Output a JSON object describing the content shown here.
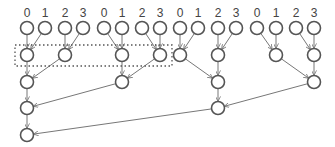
{
  "diagram": {
    "type": "reduction-tree",
    "labels": [
      "0",
      "1",
      "2",
      "3",
      "0",
      "1",
      "2",
      "3",
      "0",
      "1",
      "2",
      "3",
      "0",
      "1",
      "2",
      "3"
    ],
    "colors": {
      "node_stroke": "#555555",
      "edge": "#777777",
      "label": "#444444",
      "background": "#ffffff"
    },
    "nodes": [
      {
        "id": "t0",
        "x": 27,
        "y": 28
      },
      {
        "id": "t1",
        "x": 45,
        "y": 28
      },
      {
        "id": "t2",
        "x": 65,
        "y": 28
      },
      {
        "id": "t3",
        "x": 83,
        "y": 28
      },
      {
        "id": "t4",
        "x": 104,
        "y": 28
      },
      {
        "id": "t5",
        "x": 122,
        "y": 28
      },
      {
        "id": "t6",
        "x": 142,
        "y": 28
      },
      {
        "id": "t7",
        "x": 160,
        "y": 28
      },
      {
        "id": "t8",
        "x": 180,
        "y": 28
      },
      {
        "id": "t9",
        "x": 198,
        "y": 28
      },
      {
        "id": "t10",
        "x": 218,
        "y": 28
      },
      {
        "id": "t11",
        "x": 236,
        "y": 28
      },
      {
        "id": "t12",
        "x": 257,
        "y": 28
      },
      {
        "id": "t13",
        "x": 276,
        "y": 28
      },
      {
        "id": "t14",
        "x": 296,
        "y": 28
      },
      {
        "id": "t15",
        "x": 314,
        "y": 28
      },
      {
        "id": "a0",
        "x": 27,
        "y": 55
      },
      {
        "id": "a1",
        "x": 65,
        "y": 55
      },
      {
        "id": "a2",
        "x": 122,
        "y": 55
      },
      {
        "id": "a3",
        "x": 160,
        "y": 55
      },
      {
        "id": "a4",
        "x": 180,
        "y": 55
      },
      {
        "id": "a5",
        "x": 218,
        "y": 55
      },
      {
        "id": "a6",
        "x": 276,
        "y": 55
      },
      {
        "id": "a7",
        "x": 314,
        "y": 55
      },
      {
        "id": "b0",
        "x": 27,
        "y": 82
      },
      {
        "id": "b1",
        "x": 122,
        "y": 82
      },
      {
        "id": "b2",
        "x": 218,
        "y": 82
      },
      {
        "id": "b3",
        "x": 314,
        "y": 82
      },
      {
        "id": "c0",
        "x": 27,
        "y": 108
      },
      {
        "id": "c1",
        "x": 218,
        "y": 108
      },
      {
        "id": "d0",
        "x": 27,
        "y": 135
      }
    ],
    "edges": [
      [
        "t0",
        "a0"
      ],
      [
        "t1",
        "a0"
      ],
      [
        "t2",
        "a1"
      ],
      [
        "t3",
        "a1"
      ],
      [
        "t4",
        "a2"
      ],
      [
        "t5",
        "a2"
      ],
      [
        "t6",
        "a3"
      ],
      [
        "t7",
        "a3"
      ],
      [
        "t8",
        "a4"
      ],
      [
        "t9",
        "a4"
      ],
      [
        "t10",
        "a5"
      ],
      [
        "t11",
        "a5"
      ],
      [
        "t12",
        "a6"
      ],
      [
        "t13",
        "a6"
      ],
      [
        "t14",
        "a7"
      ],
      [
        "t15",
        "a7"
      ],
      [
        "a0",
        "b0"
      ],
      [
        "a1",
        "b0"
      ],
      [
        "a2",
        "b1"
      ],
      [
        "a3",
        "b1"
      ],
      [
        "a4",
        "b2"
      ],
      [
        "a5",
        "b2"
      ],
      [
        "a6",
        "b3"
      ],
      [
        "a7",
        "b3"
      ],
      [
        "b0",
        "c0"
      ],
      [
        "b1",
        "c0"
      ],
      [
        "b2",
        "c1"
      ],
      [
        "b3",
        "c1"
      ],
      [
        "c0",
        "d0"
      ],
      [
        "c1",
        "d0"
      ]
    ],
    "highlight_box": {
      "x": 15,
      "y": 45,
      "width": 157,
      "height": 21
    }
  }
}
